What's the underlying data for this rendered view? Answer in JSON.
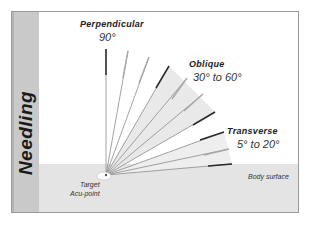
{
  "title": "Needling",
  "angles": {
    "perpendicular": {
      "label": "Perpendicular",
      "value": "90°"
    },
    "oblique": {
      "label": "Oblique",
      "value": "30° to 60°"
    },
    "transverse": {
      "label": "Transverse",
      "value": "5° to 20°"
    }
  },
  "target": {
    "line1": "Target",
    "line2": "Acu-point"
  },
  "surface_label": "Body surface",
  "needles_degrees": [
    90,
    80,
    70,
    60,
    50,
    40,
    30,
    20,
    12,
    5
  ],
  "colors": {
    "side_bar": "#c9c9c9",
    "surface": "#e4e4e4",
    "wedge": "#ececec",
    "needle_shaft": "#8a8a8a",
    "needle_handle": "#2a2a2a"
  }
}
